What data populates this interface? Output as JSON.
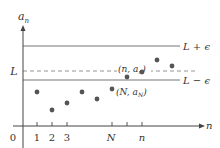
{
  "diagram": {
    "colors": {
      "axis": "#444444",
      "line": "#777777",
      "dashed": "#888888",
      "point": "#555555",
      "text": "#333333"
    },
    "axes": {
      "y_label_main": "a",
      "y_label_sub": "n",
      "x_label": "n",
      "origin_label": "0"
    },
    "lines": {
      "upper_label": "L + ϵ",
      "center_label": "L",
      "lower_label": "L − ϵ"
    },
    "ticks": [
      {
        "label": "1",
        "x": 37
      },
      {
        "label": "2",
        "x": 52
      },
      {
        "label": "3",
        "x": 67
      },
      {
        "label": "N",
        "x": 112
      },
      {
        "label": "",
        "x": 127
      },
      {
        "label": "n",
        "x": 142
      }
    ],
    "annotations": {
      "point_n_label": "(n, a",
      "point_n_sub": "n",
      "point_n_close": ")",
      "point_N_label": "(N, a",
      "point_N_sub": "N",
      "point_N_close": ")"
    },
    "points": [
      {
        "x": 37,
        "y": 92
      },
      {
        "x": 52,
        "y": 110
      },
      {
        "x": 67,
        "y": 103
      },
      {
        "x": 82,
        "y": 92
      },
      {
        "x": 97,
        "y": 99
      },
      {
        "x": 112,
        "y": 89
      },
      {
        "x": 127,
        "y": 77
      },
      {
        "x": 142,
        "y": 72
      },
      {
        "x": 157,
        "y": 60
      },
      {
        "x": 172,
        "y": 66
      }
    ]
  }
}
